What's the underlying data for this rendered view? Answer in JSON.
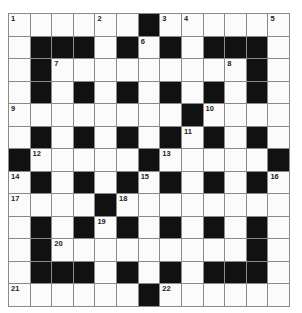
{
  "puzzle": {
    "type": "crossword",
    "rows": 13,
    "cols": 13,
    "colors": {
      "block": "#111111",
      "cell": "#fbfbfb",
      "line": "#8a8a8a"
    },
    "grid": [
      [
        "1",
        "",
        "",
        "",
        "2",
        "",
        "#",
        "3",
        "4",
        "",
        "",
        "",
        "5"
      ],
      [
        "",
        "#",
        "#",
        "#",
        "",
        "#",
        "6",
        "#",
        "",
        "#",
        "#",
        "#",
        ""
      ],
      [
        "",
        "#",
        "7",
        "",
        "",
        "",
        "",
        "",
        "",
        "",
        "8",
        "#",
        ""
      ],
      [
        "",
        "#",
        "",
        "#",
        "",
        "#",
        "",
        "#",
        "",
        "#",
        "",
        "#",
        ""
      ],
      [
        "9",
        "",
        "",
        "",
        "",
        "",
        "",
        "",
        "#",
        "10",
        "",
        "",
        ""
      ],
      [
        "",
        "#",
        "",
        "#",
        "",
        "#",
        "",
        "#",
        "11",
        "#",
        "",
        "#",
        ""
      ],
      [
        "#",
        "12",
        "",
        "",
        "",
        "",
        "#",
        "13",
        "",
        "",
        "",
        "",
        "#"
      ],
      [
        "14",
        "#",
        "",
        "#",
        "",
        "#",
        "15",
        "#",
        "",
        "#",
        "",
        "#",
        "16"
      ],
      [
        "17",
        "",
        "",
        "",
        "#",
        "18",
        "",
        "",
        "",
        "",
        "",
        "",
        ""
      ],
      [
        "",
        "#",
        "",
        "#",
        "19",
        "#",
        "",
        "#",
        "",
        "#",
        "",
        "#",
        ""
      ],
      [
        "",
        "#",
        "20",
        "",
        "",
        "",
        "",
        "",
        "",
        "",
        "",
        "#",
        ""
      ],
      [
        "",
        "#",
        "#",
        "#",
        "",
        "#",
        "",
        "#",
        "",
        "#",
        "#",
        "#",
        ""
      ],
      [
        "21",
        "",
        "",
        "",
        "",
        "",
        "#",
        "22",
        "",
        "",
        "",
        "",
        ""
      ]
    ],
    "clue_numbers": [
      1,
      2,
      3,
      4,
      5,
      6,
      7,
      8,
      9,
      10,
      11,
      12,
      13,
      14,
      15,
      16,
      17,
      18,
      19,
      20,
      21,
      22
    ]
  }
}
